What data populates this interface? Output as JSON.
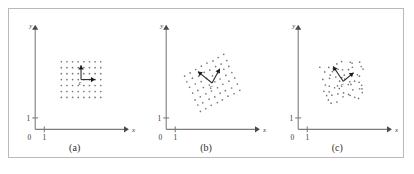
{
  "figure": {
    "panel_count": 3,
    "background_color": "#ffffff",
    "frame_color": "#b9b9b9",
    "axis_color": "#7d7d7d",
    "point_color": "#777777",
    "vector_color": "#2b2b2b"
  },
  "axes": {
    "x_label": "x",
    "y_label": "y",
    "origin_label": "0",
    "x_tick_label": "1",
    "y_tick_label": "1"
  },
  "chart_data": {
    "type": "scatter",
    "title": "",
    "xlabel": "x",
    "ylabel": "y",
    "grid": false,
    "legend": null,
    "xlim": [
      0,
      10
    ],
    "ylim": [
      0,
      8
    ],
    "panels": [
      {
        "caption": "(a)",
        "center_label": "c",
        "lattice": {
          "kind": "axis-aligned-grid",
          "cols": 8,
          "rows": 7,
          "col_spacing": 0.62,
          "row_spacing": 0.52,
          "shear_x": 0.0,
          "shear_y": 0.0,
          "jitter": 0.0,
          "center_x": 5.05,
          "center_y": 4.35
        },
        "vectors": [
          {
            "name": "v1",
            "dx": 0.0,
            "dy": 1.25
          },
          {
            "name": "v2",
            "dx": 1.55,
            "dy": 0.0
          }
        ]
      },
      {
        "caption": "(b)",
        "center_label": "c",
        "lattice": {
          "kind": "sheared-grid",
          "cols": 8,
          "rows": 7,
          "col_spacing": 0.62,
          "row_spacing": 0.52,
          "shear_x": -0.55,
          "shear_y": 0.42,
          "jitter": 0.05,
          "center_x": 5.05,
          "center_y": 4.05
        },
        "vectors": [
          {
            "name": "v1",
            "dx": -1.55,
            "dy": 1.0
          },
          {
            "name": "v2",
            "dx": 0.85,
            "dy": 1.25
          }
        ]
      },
      {
        "caption": "(c)",
        "center_label": "c",
        "lattice": {
          "kind": "noisy-cloud",
          "cols": 8,
          "rows": 7,
          "col_spacing": 0.58,
          "row_spacing": 0.5,
          "shear_x": -0.2,
          "shear_y": 0.18,
          "jitter": 0.26,
          "center_x": 4.95,
          "center_y": 4.2
        },
        "vectors": [
          {
            "name": "v1",
            "dx": -1.1,
            "dy": 1.3
          },
          {
            "name": "v2",
            "dx": 1.15,
            "dy": 0.75
          }
        ]
      }
    ]
  }
}
